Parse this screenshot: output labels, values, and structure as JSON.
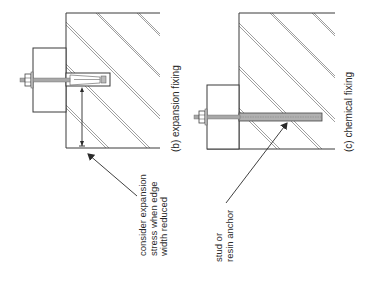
{
  "diagrams": [
    {
      "id": "b",
      "caption": "(b) expansion fixing",
      "annotation": {
        "lines": [
          "consider expansion",
          "stress when edge",
          "width reduced"
        ]
      },
      "components": [
        "wall (hatched)",
        "fixing plate",
        "threaded rod with nut",
        "expansion sleeve",
        "edge distance dimension arrow"
      ]
    },
    {
      "id": "c",
      "caption": "(c) chemical fixing",
      "annotation": {
        "lines": [
          "stud or",
          "resin anchor"
        ]
      },
      "components": [
        "wall (hatched)",
        "fixing plate",
        "threaded stud with nut",
        "resin-bonded stud in wall"
      ]
    }
  ],
  "colors": {
    "line": "#3a3a3a",
    "hatch": "#6a6a6a",
    "rod": "#9a9a9a",
    "text": "#2a2a2a"
  }
}
